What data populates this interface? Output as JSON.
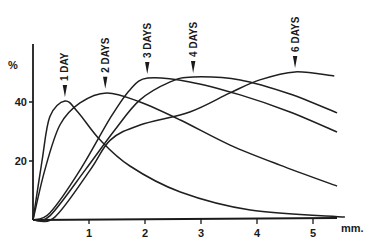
{
  "chart_data": {
    "type": "line",
    "title": "",
    "xlabel": "mm.",
    "ylabel": "%",
    "xlim": [
      0,
      5.6
    ],
    "ylim": [
      0,
      52
    ],
    "x_ticks": [
      1,
      2,
      3,
      4,
      5
    ],
    "x_tick_labels": [
      "1",
      "2",
      "3",
      "4",
      "5"
    ],
    "y_ticks": [
      20,
      40
    ],
    "y_tick_labels": [
      "20",
      "40"
    ],
    "grid": false,
    "legend": "none (curves labeled by arrow annotations at peaks)",
    "annotations": [
      {
        "label": "1 DAY",
        "x": 0.57
      },
      {
        "label": "2 DAYS",
        "x": 1.29
      },
      {
        "label": "3 DAYS",
        "x": 2.04
      },
      {
        "label": "4 DAYS",
        "x": 2.86
      },
      {
        "label": "6 DAYS",
        "x": 4.68
      }
    ],
    "series": [
      {
        "name": "1 DAY",
        "x": [
          0,
          0.16,
          0.3,
          0.57,
          0.8,
          1.2,
          1.73,
          2.63,
          3.88,
          5.57
        ],
        "y": [
          0,
          20,
          35,
          40.3,
          36.6,
          27.1,
          18.3,
          9.5,
          3.4,
          1.0
        ]
      },
      {
        "name": "2 DAYS",
        "x": [
          0,
          0.21,
          0.48,
          0.84,
          1.32,
          1.91,
          2.63,
          3.52,
          4.41,
          5.43
        ],
        "y": [
          0,
          16.9,
          32.2,
          39.7,
          43.1,
          40.0,
          33.9,
          25.4,
          18.6,
          11.5
        ]
      },
      {
        "name": "3 DAYS",
        "x": [
          0,
          0.3,
          0.84,
          1.38,
          1.73,
          2.05,
          2.8,
          3.7,
          4.59,
          5.43
        ],
        "y": [
          0,
          2.4,
          16.9,
          34.6,
          44.1,
          48.1,
          46.8,
          42.4,
          36.6,
          29.8
        ]
      },
      {
        "name": "4 DAYS",
        "x": [
          0,
          0.3,
          0.93,
          1.46,
          1.91,
          2.45,
          2.86,
          3.7,
          4.59,
          5.43
        ],
        "y": [
          0,
          1.4,
          16.9,
          30.5,
          40.7,
          46.8,
          48.5,
          47.5,
          42.7,
          36.3
        ]
      },
      {
        "name": "6 DAYS",
        "x": [
          0,
          0.39,
          1.02,
          1.38,
          1.91,
          2.8,
          3.52,
          4.05,
          4.68,
          5.38
        ],
        "y": [
          0,
          1.0,
          16.9,
          27.1,
          32.2,
          36.6,
          43.1,
          47.5,
          50.2,
          48.8
        ]
      }
    ]
  },
  "axis": {
    "y_unit": "%",
    "x_unit": "mm."
  }
}
